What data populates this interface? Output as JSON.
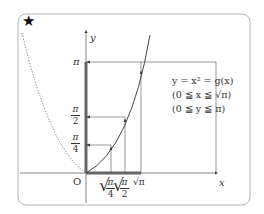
{
  "figure": {
    "marker": "★",
    "axes": {
      "x_label": "x",
      "y_label": "y",
      "origin_label": "O"
    },
    "y_ticks": [
      {
        "label": "π",
        "type": "single"
      },
      {
        "num": "π",
        "den": "2",
        "type": "fraction"
      },
      {
        "num": "π",
        "den": "4",
        "type": "fraction"
      }
    ],
    "x_ticks": [
      {
        "num": "π",
        "den": "4",
        "label": "√(π/4)"
      },
      {
        "num": "π",
        "den": "2",
        "label": "√(π/2)"
      },
      {
        "label": "√π",
        "radicand": "π"
      }
    ],
    "equations": [
      "y = x² = g(x)",
      "(0 ≦ x ≦ √π)",
      "(0 ≦ y ≦ π)"
    ],
    "colors": {
      "frame": "#b5b5b5",
      "curve": "#333333",
      "thick_segment": "#666666",
      "guide_lines": "#555555"
    }
  }
}
